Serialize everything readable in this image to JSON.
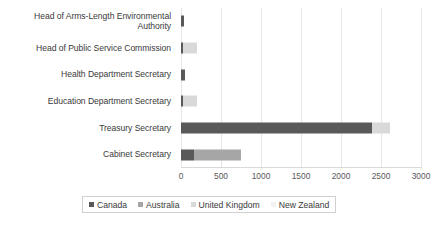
{
  "chart_data": {
    "type": "bar",
    "orientation": "horizontal",
    "stacked": true,
    "title": "",
    "xlabel": "",
    "ylabel": "",
    "xlim": [
      0,
      3000
    ],
    "xticks": [
      0,
      500,
      1000,
      1500,
      2000,
      2500,
      3000
    ],
    "xtick_labels": [
      "0",
      "500",
      "1000",
      "1500",
      "2000",
      "2500",
      "3000"
    ],
    "grid": true,
    "legend_position": "bottom",
    "categories": [
      "Head of Arms-Length Environmental Authority",
      "Head of Public Service Commission",
      "Health Department Secretary",
      "Education Department Secretary",
      "Treasury Secretary",
      "Cabinet Secretary"
    ],
    "series": [
      {
        "name": "Canada",
        "color": "#595959",
        "values": [
          35,
          25,
          55,
          30,
          2390,
          165
        ]
      },
      {
        "name": "Australia",
        "color": "#a6a6a6",
        "values": [
          0,
          0,
          0,
          0,
          0,
          580
        ]
      },
      {
        "name": "United Kingdom",
        "color": "#d9d9d9",
        "values": [
          0,
          175,
          0,
          175,
          220,
          0
        ]
      },
      {
        "name": "New Zealand",
        "color": "#f2f2f2",
        "values": [
          0,
          0,
          0,
          0,
          0,
          0
        ]
      }
    ]
  },
  "legend": {
    "items": [
      {
        "label": "Canada",
        "color": "#595959"
      },
      {
        "label": "Australia",
        "color": "#a6a6a6"
      },
      {
        "label": "United Kingdom",
        "color": "#d9d9d9"
      },
      {
        "label": "New Zealand",
        "color": "#f2f2f2"
      }
    ]
  }
}
